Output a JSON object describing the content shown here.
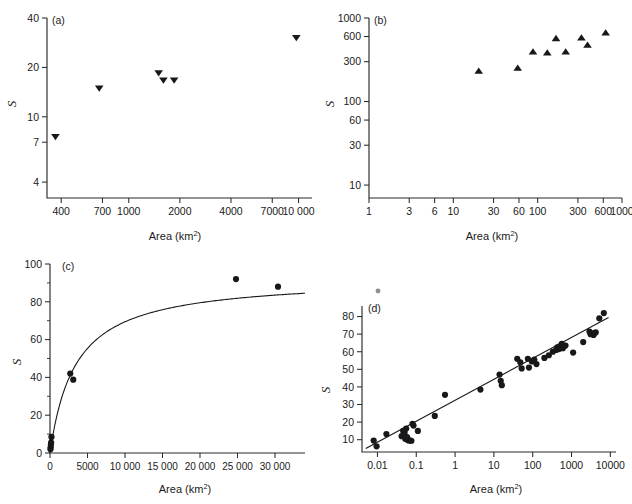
{
  "figure": {
    "panels": [
      "(a)",
      "(b)",
      "(c)",
      "(d)"
    ],
    "axis_title": "Area (km",
    "axis_title_sup": "2",
    "axis_title_close": ")",
    "ylabel": "S"
  },
  "chart_data": [
    {
      "type": "scatter",
      "panel": "(a)",
      "title": "",
      "xlabel": "Area (km2)",
      "ylabel": "S",
      "xscale": "log",
      "yscale": "log",
      "xlim": [
        330,
        12000
      ],
      "ylim": [
        3.2,
        40
      ],
      "xticks": [
        400,
        700,
        1000,
        2000,
        4000,
        7000,
        10000
      ],
      "xticklabels": [
        "400",
        "700",
        "1000",
        "2000",
        "4000",
        "7000",
        "10 000"
      ],
      "yticks": [
        4,
        7,
        10,
        20,
        40
      ],
      "yticklabels": [
        "4",
        "7",
        "10",
        "20",
        "40"
      ],
      "marker": "triangle-down",
      "grid": false,
      "legend": "none",
      "points": [
        {
          "x": 370,
          "y": 7.6
        },
        {
          "x": 670,
          "y": 15.0
        },
        {
          "x": 1500,
          "y": 18.6
        },
        {
          "x": 1600,
          "y": 16.8
        },
        {
          "x": 1850,
          "y": 16.8
        },
        {
          "x": 9700,
          "y": 30.5
        }
      ]
    },
    {
      "type": "scatter",
      "panel": "(b)",
      "title": "",
      "xlabel": "Area (km2)",
      "ylabel": "S",
      "xscale": "log",
      "yscale": "log",
      "xlim": [
        1,
        1000
      ],
      "ylim": [
        7,
        1000
      ],
      "xticks": [
        1,
        3,
        6,
        10,
        30,
        60,
        100,
        300,
        600,
        1000
      ],
      "xticklabels": [
        "1",
        "3",
        "6",
        "10",
        "30",
        "60",
        "100",
        "300",
        "600",
        "1000"
      ],
      "yticks": [
        10,
        30,
        60,
        100,
        300,
        600,
        1000
      ],
      "yticklabels": [
        "10",
        "30",
        "60",
        "100",
        "300",
        "600",
        "1000"
      ],
      "marker": "triangle-up",
      "grid": false,
      "legend": "none",
      "points": [
        {
          "x": 20,
          "y": 230
        },
        {
          "x": 58,
          "y": 250
        },
        {
          "x": 88,
          "y": 390
        },
        {
          "x": 130,
          "y": 380
        },
        {
          "x": 165,
          "y": 565
        },
        {
          "x": 215,
          "y": 390
        },
        {
          "x": 330,
          "y": 575
        },
        {
          "x": 390,
          "y": 470
        },
        {
          "x": 640,
          "y": 660
        }
      ]
    },
    {
      "type": "scatter",
      "panel": "(c)",
      "title": "",
      "xlabel": "Area (km2)",
      "ylabel": "S",
      "xscale": "linear",
      "yscale": "linear",
      "xlim": [
        0,
        34000
      ],
      "ylim": [
        0,
        100
      ],
      "xticks": [
        0,
        5000,
        10000,
        15000,
        20000,
        25000,
        30000
      ],
      "xticklabels": [
        "0",
        "5000",
        "10 000",
        "15 000",
        "20 000",
        "25 000",
        "30 000"
      ],
      "yticks": [
        0,
        20,
        40,
        60,
        80,
        100
      ],
      "yticklabels": [
        "0",
        "20",
        "40",
        "60",
        "80",
        "100"
      ],
      "yticks_minor": [
        10,
        30,
        50,
        70,
        90
      ],
      "marker": "circle",
      "grid": false,
      "legend": "none",
      "fit": {
        "kind": "saturating",
        "smax": 93,
        "k": 3400
      },
      "points": [
        {
          "x": 60,
          "y": 2.0
        },
        {
          "x": 90,
          "y": 3.0
        },
        {
          "x": 120,
          "y": 4.5
        },
        {
          "x": 150,
          "y": 5.5
        },
        {
          "x": 200,
          "y": 8.5
        },
        {
          "x": 2700,
          "y": 42.0
        },
        {
          "x": 3100,
          "y": 38.8
        },
        {
          "x": 24800,
          "y": 92.0
        },
        {
          "x": 30400,
          "y": 88.0
        }
      ]
    },
    {
      "type": "scatter",
      "panel": "(d)",
      "title": "",
      "xlabel": "Area (km2)",
      "ylabel": "S",
      "xscale": "log",
      "yscale": "linear",
      "xlim": [
        0.004,
        14000
      ],
      "ylim": [
        3,
        86
      ],
      "xticks": [
        0.01,
        0.1,
        1,
        10,
        100,
        1000,
        10000
      ],
      "xticklabels": [
        "0.01",
        "0.1",
        "1",
        "10",
        "100",
        "1000",
        "10000"
      ],
      "yticks": [
        10,
        20,
        30,
        40,
        50,
        60,
        70,
        80
      ],
      "yticklabels": [
        "10",
        "20",
        "30",
        "40",
        "50",
        "60",
        "70",
        "80"
      ],
      "marker": "circle",
      "grid": false,
      "legend": "none",
      "fit": {
        "kind": "loglinear",
        "x0": 0.005,
        "y0": 5.0,
        "x1": 9000,
        "y1": 79.5
      },
      "points": [
        {
          "x": 0.008,
          "y": 9.5
        },
        {
          "x": 0.0095,
          "y": 6.2
        },
        {
          "x": 0.017,
          "y": 13.2
        },
        {
          "x": 0.042,
          "y": 12.0
        },
        {
          "x": 0.046,
          "y": 15.0
        },
        {
          "x": 0.05,
          "y": 14.0
        },
        {
          "x": 0.052,
          "y": 10.5
        },
        {
          "x": 0.055,
          "y": 16.3
        },
        {
          "x": 0.058,
          "y": 11.5
        },
        {
          "x": 0.06,
          "y": 9.8
        },
        {
          "x": 0.065,
          "y": 9.6
        },
        {
          "x": 0.07,
          "y": 9.5
        },
        {
          "x": 0.075,
          "y": 9.4
        },
        {
          "x": 0.08,
          "y": 19.0
        },
        {
          "x": 0.085,
          "y": 18.0
        },
        {
          "x": 0.11,
          "y": 15.0
        },
        {
          "x": 0.3,
          "y": 23.5
        },
        {
          "x": 0.55,
          "y": 35.5
        },
        {
          "x": 4.5,
          "y": 38.5
        },
        {
          "x": 14,
          "y": 47.0
        },
        {
          "x": 15,
          "y": 43.5
        },
        {
          "x": 16,
          "y": 41.0
        },
        {
          "x": 40,
          "y": 56.0
        },
        {
          "x": 48,
          "y": 54.0
        },
        {
          "x": 52,
          "y": 50.5
        },
        {
          "x": 75,
          "y": 56.0
        },
        {
          "x": 80,
          "y": 51.0
        },
        {
          "x": 95,
          "y": 54.5
        },
        {
          "x": 110,
          "y": 55.5
        },
        {
          "x": 125,
          "y": 53.0
        },
        {
          "x": 200,
          "y": 56.5
        },
        {
          "x": 260,
          "y": 58.0
        },
        {
          "x": 330,
          "y": 60.0
        },
        {
          "x": 400,
          "y": 61.0
        },
        {
          "x": 430,
          "y": 62.5
        },
        {
          "x": 470,
          "y": 61.5
        },
        {
          "x": 500,
          "y": 63.0
        },
        {
          "x": 520,
          "y": 62.0
        },
        {
          "x": 560,
          "y": 64.5
        },
        {
          "x": 600,
          "y": 62.0
        },
        {
          "x": 700,
          "y": 63.5
        },
        {
          "x": 1100,
          "y": 59.5
        },
        {
          "x": 2000,
          "y": 65.5
        },
        {
          "x": 2900,
          "y": 71.5
        },
        {
          "x": 3100,
          "y": 70.0
        },
        {
          "x": 3600,
          "y": 70.5
        },
        {
          "x": 3700,
          "y": 69.5
        },
        {
          "x": 4200,
          "y": 71.0
        },
        {
          "x": 5200,
          "y": 79.0
        },
        {
          "x": 6800,
          "y": 82.0
        }
      ]
    }
  ]
}
